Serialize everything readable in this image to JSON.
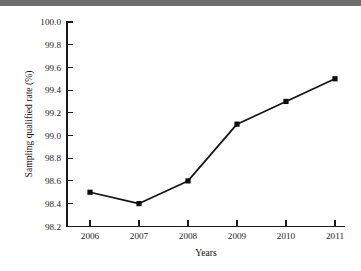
{
  "chart_data": {
    "type": "line",
    "title": "",
    "xlabel": "Years",
    "ylabel": "Sampling qualified rate (%)",
    "categories": [
      "2006",
      "2007",
      "2008",
      "2009",
      "2010",
      "2011"
    ],
    "values": [
      98.5,
      98.4,
      98.6,
      99.1,
      99.3,
      99.5
    ],
    "series": [
      {
        "name": "Sampling qualified rate",
        "values": [
          98.5,
          98.4,
          98.6,
          99.1,
          99.3,
          99.5
        ]
      }
    ],
    "ylim": [
      98.2,
      100.0
    ],
    "ytick_step": 0.2,
    "ytick_labels": [
      "98.2",
      "98.4",
      "98.6",
      "98.8",
      "99.0",
      "99.2",
      "99.4",
      "99.6",
      "99.8",
      "100.0"
    ],
    "xtick_labels": [
      "2006",
      "2007",
      "2008",
      "2009",
      "2010",
      "2011"
    ],
    "grid": false,
    "legend": false,
    "legend_position": "none",
    "marker": "square",
    "line_color": "#131313",
    "marker_color": "#0d0d0d"
  },
  "figure": {
    "background_color": "#ffffff",
    "top_band_color": "#6e6e6e",
    "axis_color": "#1a1a1a"
  }
}
